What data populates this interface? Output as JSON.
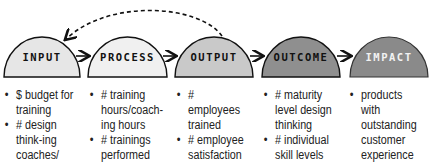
{
  "stages": [
    {
      "label": "INPUT",
      "fill": "#e6e6e6",
      "text_color": "#111111",
      "items": [
        "$ budget for training",
        "# design think-ing coaches/ trainers"
      ]
    },
    {
      "label": "PROCESS",
      "fill": "#f0f0f0",
      "text_color": "#111111",
      "items": [
        "# training hours/coach-ing hours",
        "# trainings performed"
      ]
    },
    {
      "label": "OUTPUT",
      "fill": "#c9c9c9",
      "text_color": "#111111",
      "items": [
        "# employees trained",
        "# employee satisfaction"
      ]
    },
    {
      "label": "OUTCOME",
      "fill": "#8f8f8f",
      "text_color": "#111111",
      "items": [
        "# maturity level design thinking",
        "# individual skill levels"
      ]
    },
    {
      "label": "IMPACT",
      "fill": "#8a8a8a",
      "text_color": "#f2f2f2",
      "items": [
        "products with outstanding customer experience"
      ]
    }
  ],
  "feedback_arrow": {
    "from": "OUTPUT",
    "to": "INPUT",
    "style": "dashed"
  }
}
